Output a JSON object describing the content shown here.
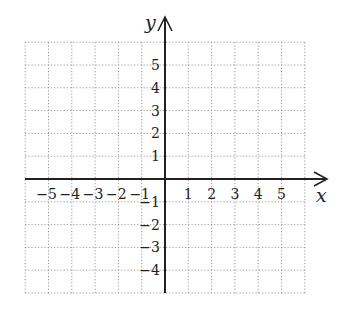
{
  "figure": {
    "type": "coordinate-plane",
    "x_axis_label": "x",
    "y_axis_label": "y",
    "x_range": [
      -6,
      6
    ],
    "y_range": [
      -5,
      6
    ],
    "grid": "dotted",
    "x_tick_labels": [
      "−5",
      "−4",
      "−3",
      "−2",
      "−1",
      "1",
      "2",
      "3",
      "4",
      "5"
    ],
    "x_tick_values": [
      -5,
      -4,
      -3,
      -2,
      -1,
      1,
      2,
      3,
      4,
      5
    ],
    "y_tick_labels": [
      "5",
      "4",
      "3",
      "2",
      "1",
      "−1",
      "−2",
      "−3",
      "−4"
    ],
    "y_tick_values": [
      5,
      4,
      3,
      2,
      1,
      -1,
      -2,
      -3,
      -4
    ],
    "colors": {
      "grid": "#9a9a9a",
      "axis": "#222222",
      "text": "#222222",
      "background": "#ffffff"
    }
  }
}
